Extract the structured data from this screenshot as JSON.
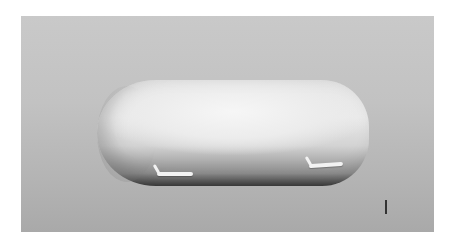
{
  "image": {
    "subject": "capsule-shaped airship model with two skids",
    "style": "grayscale 3D render",
    "colors": {
      "background_top": "#c9c9c9",
      "background_bottom": "#a9a9a9",
      "body_highlight": "#f6f6f6",
      "body_shadow": "#3f3f3f",
      "skid": "#f2f2f2"
    }
  }
}
